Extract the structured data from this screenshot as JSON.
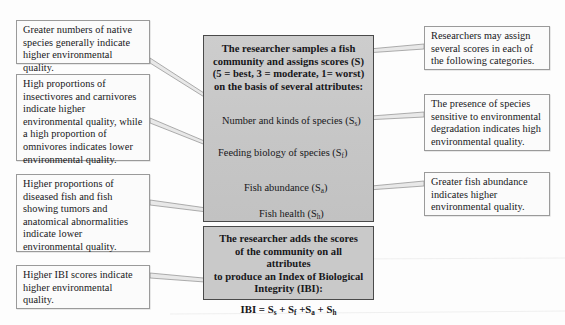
{
  "figure": {
    "background_color": "#fdfdfd",
    "grey_box_color": "#c9c9c9",
    "callout_box_color": "#fbfbfb",
    "border_color": "#4a4a4a"
  },
  "center": {
    "top_box": {
      "header_lines": [
        "The researcher samples a fish",
        "community and assigns scores (S)",
        "(5 = best, 3 = moderate, 1= worst)",
        "on the basis of several attributes:"
      ],
      "header_text": "The researcher samples a fish community and assigns scores (S) (5 = best, 3 = moderate, 1= worst) on the basis of several attributes:",
      "attributes": [
        {
          "label": "Number and kinds of species (S",
          "subscript": "s",
          "close": ")",
          "full": "Number and kinds of species (Ss)"
        },
        {
          "label": "Feeding biology of species (S",
          "subscript": "f",
          "close": ")",
          "full": "Feeding biology of species (Sf)"
        },
        {
          "label": "Fish abundance (S",
          "subscript": "a",
          "close": ")",
          "full": "Fish abundance (Sa)"
        },
        {
          "label": "Fish health (S",
          "subscript": "h",
          "close": ")",
          "full": "Fish health (Sh)"
        }
      ]
    },
    "bottom_box": {
      "text_lines": [
        "The researcher adds the scores",
        "of the community on all attributes",
        "to produce an Index of Biological",
        "Integrity (IBI):"
      ],
      "text": "The researcher adds the scores of the community on all attributes to produce an Index of Biological Integrity (IBI):",
      "formula": {
        "lhs": "IBI = ",
        "terms": [
          {
            "base": "S",
            "sub": "s"
          },
          {
            "base": "S",
            "sub": "f"
          },
          {
            "base": "S",
            "sub": "a"
          },
          {
            "base": "S",
            "sub": "h"
          }
        ],
        "plain": "IBI = Ss + Sf + Sa + Sh"
      }
    }
  },
  "left_callouts": [
    {
      "id": "native-species",
      "text": "Greater numbers of native species generally indicate higher environmental quality."
    },
    {
      "id": "feeding-biology",
      "text": "High proportions of insectivores and carnivores indicate higher environmental quality, while a high proportion of omnivores indicates lower environmental quality."
    },
    {
      "id": "fish-health",
      "text": "Higher proportions of diseased fish and fish showing tumors and anatomical abnormalities indicate lower environmental quality."
    },
    {
      "id": "ibi-scores",
      "text": "Higher IBI scores indicate higher environmental quality."
    }
  ],
  "right_callouts": [
    {
      "id": "several-scores",
      "text": "Researchers may assign several scores in each of the following categories."
    },
    {
      "id": "sensitive-species",
      "text": "The presence of species sensitive to environmental degradation indicates high environmental quality."
    },
    {
      "id": "fish-abundance",
      "text": "Greater fish abundance indicates higher environmental quality."
    }
  ]
}
